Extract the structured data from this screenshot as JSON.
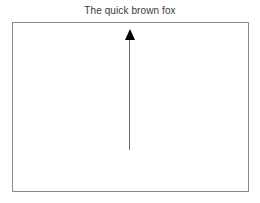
{
  "figure": {
    "title": "The quick brown fox",
    "background_color": "#ffffff",
    "width": 260,
    "height": 203
  },
  "plot_area": {
    "border_color": "#8a8a8a",
    "border_width_px": 1,
    "fill_color": "#ffffff",
    "left_px": 12,
    "top_px": 22,
    "width_px": 237,
    "height_px": 170
  },
  "annotations": [
    {
      "type": "arrow",
      "name": "up-arrow",
      "direction": "up",
      "color": "#000000",
      "shaft_color": "#6e6e6e",
      "x_px": 130,
      "tail_y_px": 150,
      "head_y_px": 29,
      "head_width_px": 10,
      "head_length_px": 11,
      "shaft_width_px": 1
    }
  ],
  "chart_data": {
    "type": "line",
    "title": "The quick brown fox",
    "subtitle": "",
    "xlabel": "",
    "ylabel": "",
    "categories": [],
    "values": [],
    "series": [],
    "xticks": [],
    "yticks": [],
    "xticklabels": [],
    "yticklabels": [],
    "grid": false,
    "legend": false,
    "legend_position": "none",
    "annotations": [
      {
        "kind": "arrow",
        "text": "",
        "direction": "up",
        "x": 0.495,
        "y_start": 0.247,
        "y_end": 0.959,
        "coordinate_system": "axes-fraction"
      }
    ]
  }
}
